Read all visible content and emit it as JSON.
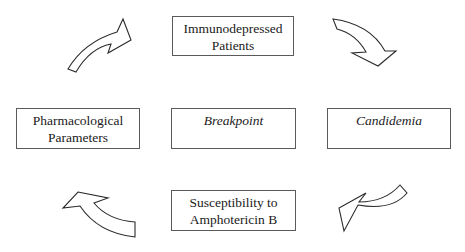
{
  "diagram": {
    "type": "cycle",
    "nodes": {
      "top": {
        "lines": [
          "Immunodepressed",
          "Patients"
        ],
        "italic": false
      },
      "right": {
        "lines": [
          "Candidemia"
        ],
        "italic": true
      },
      "bottom": {
        "lines": [
          "Susceptibility to",
          "Amphotericin B"
        ],
        "italic": false
      },
      "left": {
        "lines": [
          "Pharmacological",
          "Parameters"
        ],
        "italic": false
      },
      "center": {
        "lines": [
          "Breakpoint"
        ],
        "italic": true
      }
    },
    "arrows": [
      {
        "from": "left",
        "to": "top",
        "direction": "up-right"
      },
      {
        "from": "top",
        "to": "right",
        "direction": "down-right"
      },
      {
        "from": "right",
        "to": "bottom",
        "direction": "down-left"
      },
      {
        "from": "bottom",
        "to": "left",
        "direction": "up-left"
      }
    ]
  }
}
